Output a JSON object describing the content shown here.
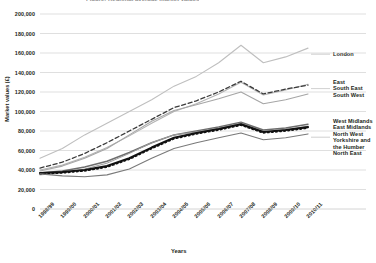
{
  "chart_data": {
    "type": "line",
    "title": "Figure: Regional average market values",
    "xlabel": "Years",
    "ylabel": "Market values (£)",
    "ylim": [
      0,
      200000
    ],
    "ytick_labels": [
      "0",
      "20,000",
      "40,000",
      "60,000",
      "80,000",
      "100,000",
      "120,000",
      "140,000",
      "160,000",
      "180,000",
      "200,000"
    ],
    "ytick_values": [
      0,
      20000,
      40000,
      60000,
      80000,
      100000,
      120000,
      140000,
      160000,
      180000,
      200000
    ],
    "grid": true,
    "legend_position": "right",
    "categories": [
      "1998/99",
      "1999/00",
      "2000/01",
      "2001/02",
      "2002/03",
      "2003/04",
      "2004/05",
      "2005/06",
      "2006/07",
      "2007/08",
      "2008/09",
      "2009/10",
      "2010/11"
    ],
    "series": [
      {
        "name": "London",
        "values": [
          52000,
          62000,
          76000,
          88000,
          100000,
          112000,
          126000,
          136000,
          150000,
          168000,
          150000,
          156000,
          165000
        ],
        "color": "#bfbfbf",
        "style": "solid",
        "width": 1.1
      },
      {
        "name": "East",
        "values": [
          40000,
          45000,
          53000,
          63000,
          75000,
          88000,
          100000,
          108000,
          118000,
          130000,
          117000,
          122000,
          128000
        ],
        "color": "#b3b3b3",
        "style": "solid",
        "width": 1.1
      },
      {
        "name": "South East",
        "values": [
          42000,
          48000,
          57000,
          68000,
          80000,
          92000,
          104000,
          111000,
          120000,
          131000,
          118000,
          123000,
          127000
        ],
        "color": "#3b3b3b",
        "style": "dashed",
        "width": 1.3
      },
      {
        "name": "South West",
        "values": [
          39000,
          44000,
          52000,
          62000,
          76000,
          90000,
          101000,
          107000,
          113000,
          120000,
          108000,
          112000,
          118000
        ],
        "color": "#a6a6a6",
        "style": "solid",
        "width": 1.1
      },
      {
        "name": "West Midlands",
        "values": [
          37000,
          39000,
          43000,
          49000,
          58000,
          68000,
          76000,
          80000,
          84000,
          89000,
          81000,
          83000,
          87000
        ],
        "color": "#6e6e6e",
        "style": "solid",
        "width": 1.5
      },
      {
        "name": "East Midlands",
        "values": [
          35000,
          37000,
          41000,
          47000,
          57000,
          68000,
          76000,
          79000,
          83000,
          88000,
          79000,
          81000,
          85000
        ],
        "color": "#9e9e9e",
        "style": "solid",
        "width": 1.0
      },
      {
        "name": "North West",
        "values": [
          37000,
          38000,
          40000,
          44000,
          52000,
          63000,
          73000,
          78000,
          82000,
          87000,
          79000,
          81000,
          84000
        ],
        "color": "#111111",
        "style": "solid",
        "width": 2.1
      },
      {
        "name": "Yorkshire and the Humber",
        "values": [
          36000,
          37000,
          39000,
          43000,
          51000,
          62000,
          72000,
          77000,
          81000,
          86000,
          78000,
          80000,
          83000
        ],
        "color": "#111111",
        "style": "dotted",
        "width": 1.6
      },
      {
        "name": "North East",
        "values": [
          36000,
          34000,
          33000,
          35000,
          41000,
          52000,
          62000,
          68000,
          73000,
          78000,
          71000,
          73000,
          77000
        ],
        "color": "#7a7a7a",
        "style": "solid",
        "width": 1.1
      }
    ],
    "legend_groups": [
      {
        "labels": [
          "London"
        ],
        "top": 51
      },
      {
        "labels": [
          "East",
          "South East",
          "South West"
        ],
        "top": 79
      },
      {
        "labels": [
          "West Midlands",
          "East Midlands",
          "North West",
          "Yorkshire and",
          "the Humber",
          "North East"
        ],
        "top": 118
      }
    ]
  }
}
